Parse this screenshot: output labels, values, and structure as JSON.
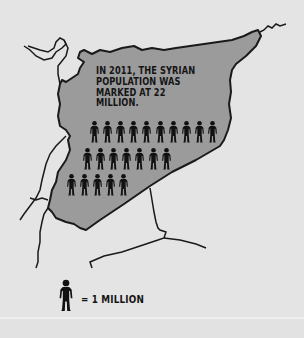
{
  "infographic": {
    "caption_lines": [
      "IN 2011, THE SYRIAN",
      "POPULATION WAS",
      "MARKED AT 22",
      "MILLION."
    ],
    "population_millions": 22,
    "year": "2011",
    "country": "Syria",
    "figure_rows": [
      10,
      7,
      5
    ],
    "legend": {
      "icon": "person-icon",
      "text": "= 1 MILLION"
    }
  },
  "colors": {
    "background": "#e4e4e4",
    "country_fill": "#9b9b9b",
    "border_line": "#1a1a1a",
    "figure": "#111111",
    "text": "#151515"
  }
}
